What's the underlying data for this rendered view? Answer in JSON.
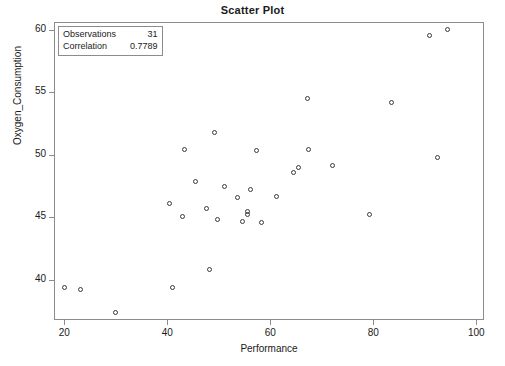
{
  "chart_data": {
    "type": "scatter",
    "title": "Scatter Plot",
    "xlabel": "Performance",
    "ylabel": "Oxygen_Consumption",
    "xlim": [
      18.0,
      101.5
    ],
    "ylim": [
      36.8,
      60.6
    ],
    "xticks": [
      20,
      40,
      60,
      80,
      100
    ],
    "yticks": [
      40,
      45,
      50,
      55,
      60
    ],
    "xticklabels": [
      "20",
      "40",
      "60",
      "80",
      "100"
    ],
    "yticklabels": [
      "40",
      "45",
      "50",
      "55",
      "60"
    ],
    "grid": false,
    "legend_position": "top-left",
    "marker": "open-circle",
    "marker_color": "#3a3a3a",
    "frame_color": "#8c8c8c",
    "series": [
      {
        "name": "Oxygen_Consumption vs Performance",
        "points": [
          [
            20.0,
            39.4
          ],
          [
            23.2,
            39.2
          ],
          [
            30.0,
            37.4
          ],
          [
            40.4,
            46.1
          ],
          [
            41.0,
            39.4
          ],
          [
            42.9,
            45.1
          ],
          [
            43.3,
            50.4
          ],
          [
            45.4,
            47.9
          ],
          [
            47.6,
            45.7
          ],
          [
            48.2,
            40.8
          ],
          [
            49.1,
            51.8
          ],
          [
            49.7,
            44.8
          ],
          [
            51.1,
            47.5
          ],
          [
            53.7,
            46.6
          ],
          [
            54.6,
            44.7
          ],
          [
            55.6,
            45.5
          ],
          [
            55.6,
            45.2
          ],
          [
            56.1,
            47.2
          ],
          [
            57.3,
            50.3
          ],
          [
            58.2,
            44.6
          ],
          [
            61.2,
            46.7
          ],
          [
            64.6,
            48.6
          ],
          [
            65.4,
            49.0
          ],
          [
            67.2,
            54.5
          ],
          [
            67.5,
            50.4
          ],
          [
            72.0,
            49.1
          ],
          [
            79.2,
            45.2
          ],
          [
            83.6,
            54.2
          ],
          [
            90.9,
            59.5
          ],
          [
            92.5,
            49.8
          ],
          [
            94.4,
            60.0
          ]
        ]
      }
    ],
    "stats": {
      "observations_label": "Observations",
      "observations_value": "31",
      "correlation_label": "Correlation",
      "correlation_value": "0.7789"
    }
  }
}
